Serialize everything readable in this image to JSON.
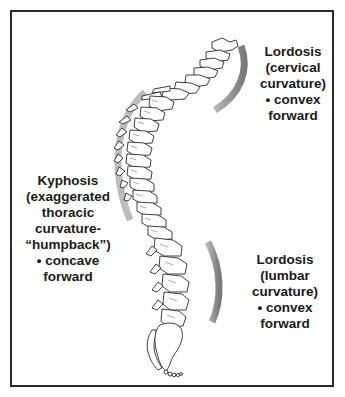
{
  "diagram": {
    "labels": {
      "cervical": {
        "lines": [
          "Lordosis",
          "(cervical",
          "curvature)",
          "• convex",
          "forward"
        ]
      },
      "thoracic": {
        "lines": [
          "Kyphosis",
          "(exaggerated",
          "thoracic",
          "curvature-",
          "“humpback”)",
          "• concave",
          "forward"
        ]
      },
      "lumbar": {
        "lines": [
          "Lordosis",
          "(lumbar",
          "curvature)",
          "• convex",
          "forward"
        ]
      }
    },
    "colors": {
      "arc": "#8c8c8c",
      "arc_light": "#b8b8b8",
      "outline": "#2a2a2a",
      "text": "#1a1a1a"
    }
  }
}
